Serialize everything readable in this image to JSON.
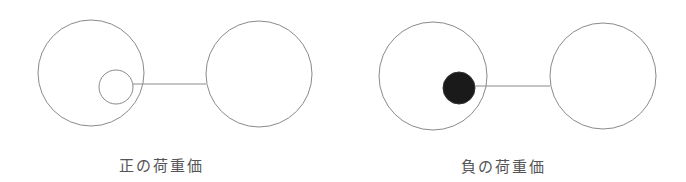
{
  "diagram": {
    "panels": [
      {
        "name": "positive-weight",
        "label": "正の荷重価",
        "label_x": 161,
        "label_y": 154,
        "outer_circle_1": {
          "cx": 91,
          "cy": 73,
          "r": 53
        },
        "inner_circle": {
          "cx": 116,
          "cy": 87,
          "r": 17,
          "filled": false
        },
        "connector": {
          "x1": 133,
          "y1": 84,
          "x2": 206,
          "y2": 84
        },
        "outer_circle_2": {
          "cx": 259,
          "cy": 74,
          "r": 53
        }
      },
      {
        "name": "negative-weight",
        "label": "負の荷重価",
        "label_x": 503,
        "label_y": 155,
        "outer_circle_1": {
          "cx": 433,
          "cy": 76,
          "r": 54
        },
        "inner_circle": {
          "cx": 459,
          "cy": 88,
          "r": 16,
          "filled": true
        },
        "connector": {
          "x1": 475,
          "y1": 86,
          "x2": 550,
          "y2": 86
        },
        "outer_circle_2": {
          "cx": 603,
          "cy": 76,
          "r": 53
        }
      }
    ],
    "colors": {
      "stroke": "#8a8a8a",
      "fill": "#1a1a1a",
      "text": "#555555"
    }
  }
}
